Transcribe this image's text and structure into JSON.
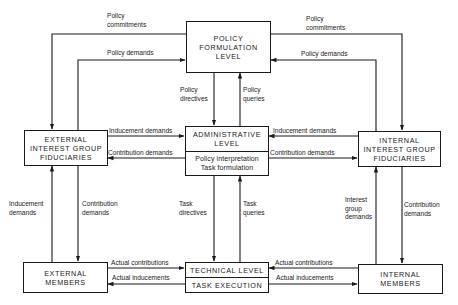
{
  "nodes": {
    "policy": {
      "label": "POLICY\nFORMULATION\nLEVEL"
    },
    "admin": {
      "title": "ADMINISTRATIVE\nLEVEL",
      "subtitle": "Policy interpretation\nTask formulation"
    },
    "ext_interest": {
      "label": "EXTERNAL\nINTEREST GROUP\nFIDUCIARIES"
    },
    "int_interest": {
      "label": "INTERNAL\nINTEREST GROUP\nFIDUCIARIES"
    },
    "ext_members": {
      "label": "EXTERNAL\nMEMBERS"
    },
    "technical": {
      "title": "TECHNICAL LEVEL",
      "subtitle": "TASK EXECUTION"
    },
    "int_members": {
      "label": "INTERNAL\nMEMBERS"
    }
  },
  "edges": {
    "policy_commitments_left": "Policy\ncommitments",
    "policy_commitments_right": "Policy\ncommitments",
    "policy_demands_left": "Policy demands",
    "policy_demands_right": "Policy demands",
    "policy_directives": "Policy\ndirectives",
    "policy_queries": "Policy\nqueries",
    "inducement_demands_left": "Inducement demands",
    "contribution_demands_left": "Contribution demands",
    "inducement_demands_right": "Inducement demands",
    "contribution_demands_right": "Contribution demands",
    "ext_inducement_demands": "Inducement\ndemands",
    "ext_contribution_demands": "Contribution\ndemands",
    "task_directives": "Task\ndirectives",
    "task_queries": "Task\nqueries",
    "int_interest_group_demands": "Interest\ngroup\ndemands",
    "int_contribution_demands": "Contribution\ndemands",
    "actual_contributions_left": "Actual contributions",
    "actual_inducements_left": "Actual inducements",
    "actual_contributions_right": "Actual contributions",
    "actual_inducements_right": "Actual inducements"
  },
  "colors": {
    "ink": "#1a1a1a",
    "background": "#ffffff"
  }
}
